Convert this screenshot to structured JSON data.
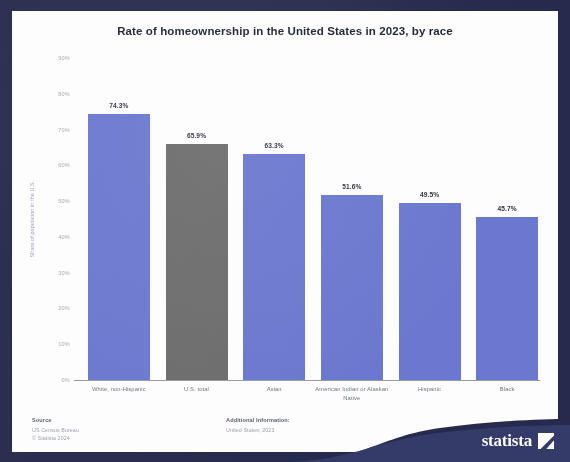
{
  "chart": {
    "title": "Rate of homeownership in the United States in 2023, by race",
    "y_axis_title": "Share of population in the U.S."
  },
  "footer": {
    "source_head": "Source",
    "source_lines": [
      "US Census Bureau",
      "© Statista 2024"
    ],
    "additional_head": "Additional Information:",
    "additional_lines": [
      "United States; 2023"
    ]
  },
  "branding": {
    "wordmark": "statista",
    "mark_name": "statista-arrow-mark"
  },
  "colors": {
    "frame": "#262b4d",
    "bar": "#6a79cf",
    "bar_total": "#6d6d6d",
    "panel": "#fdfdfd",
    "text": "#1d2233"
  },
  "chart_data": {
    "type": "bar",
    "title": "Rate of homeownership in the United States in 2023, by race",
    "xlabel": "",
    "ylabel": "Share of population in the U.S.",
    "ylim": [
      0,
      90
    ],
    "ytick_labels": [
      "90%",
      "80%",
      "70%",
      "60%",
      "50%",
      "40%",
      "30%",
      "20%",
      "10%",
      "0%"
    ],
    "ytick_values": [
      90,
      80,
      70,
      60,
      50,
      40,
      30,
      20,
      10,
      0
    ],
    "grid": false,
    "legend": "none",
    "categories": [
      "White, non-Hispanic",
      "U.S. total",
      "Asian",
      "American Indian or Alaskan Native",
      "Hispanic",
      "Black"
    ],
    "values": [
      74.3,
      65.9,
      63.3,
      51.6,
      49.5,
      45.7
    ],
    "value_labels": [
      "74.3%",
      "65.9%",
      "63.3%",
      "51.6%",
      "49.5%",
      "45.7%"
    ],
    "bar_colors": [
      "#6a79cf",
      "#6d6d6d",
      "#6a79cf",
      "#6a79cf",
      "#6a79cf",
      "#6a79cf"
    ],
    "highlight_index": 1
  }
}
